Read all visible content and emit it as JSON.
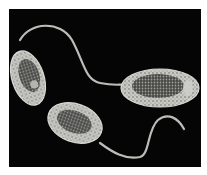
{
  "image": {
    "subject": "flagellated bacteria (micrograph illustration)",
    "background_color": "#050505",
    "margin_color": "#ffffff",
    "cell_fill_color": "#c9c9c4",
    "cell_dark_color": "#2a2a2a",
    "flagellum_color": "#bdbdb8",
    "cells": [
      {
        "name": "upper-left-cell",
        "cx": 28,
        "cy": 78,
        "rx": 16,
        "ry": 28,
        "rotate": -18
      },
      {
        "name": "lower-cell",
        "cx": 75,
        "cy": 123,
        "rx": 28,
        "ry": 19,
        "rotate": 20
      },
      {
        "name": "right-cell",
        "cx": 160,
        "cy": 88,
        "rx": 39,
        "ry": 19,
        "rotate": 2
      }
    ]
  }
}
